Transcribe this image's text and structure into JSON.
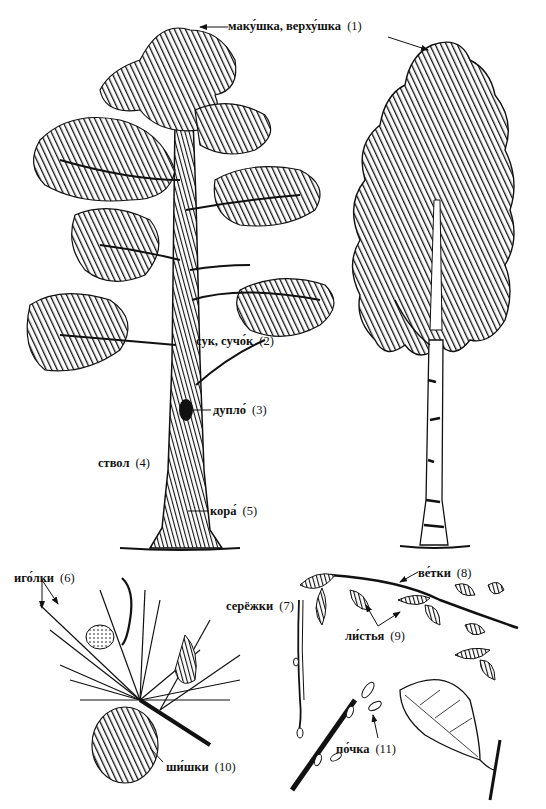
{
  "diagram": {
    "colors": {
      "ink": "#111111",
      "paper": "#ffffff"
    },
    "labels": [
      {
        "id": "1",
        "term": "маку́шка, верху́шка",
        "number": "(1)",
        "x": 228,
        "y": 22
      },
      {
        "id": "2",
        "term": "сук, сучо́к",
        "number": "(2)",
        "x": 196,
        "y": 335
      },
      {
        "id": "3",
        "term": "дупло́",
        "number": "(3)",
        "x": 213,
        "y": 404
      },
      {
        "id": "4",
        "term": "ствол",
        "number": "(4)",
        "x": 98,
        "y": 457
      },
      {
        "id": "5",
        "term": "кора́",
        "number": "(5)",
        "x": 210,
        "y": 505
      },
      {
        "id": "6",
        "term": "иго́лки",
        "number": "(6)",
        "x": 14,
        "y": 572
      },
      {
        "id": "7",
        "term": "серёжки",
        "number": "(7)",
        "x": 226,
        "y": 600
      },
      {
        "id": "8",
        "term": "ве́тки",
        "number": "(8)",
        "x": 418,
        "y": 567
      },
      {
        "id": "9",
        "term": "ли́стья",
        "number": "(9)",
        "x": 345,
        "y": 630
      },
      {
        "id": "10",
        "term": "ши́шки",
        "number": "(10)",
        "x": 166,
        "y": 761
      },
      {
        "id": "11",
        "term": "по́чка",
        "number": "(11)",
        "x": 336,
        "y": 743
      }
    ],
    "drawings": [
      {
        "id": "pine-tree",
        "name": "pine tree"
      },
      {
        "id": "birch-tree",
        "name": "birch tree"
      },
      {
        "id": "pine-branch",
        "name": "pine branch with needles and cones"
      },
      {
        "id": "birch-branch",
        "name": "birch branch with leaves"
      },
      {
        "id": "catkin",
        "name": "catkin"
      },
      {
        "id": "bud-twig",
        "name": "twig with buds"
      },
      {
        "id": "birch-leaf",
        "name": "single birch leaf"
      }
    ]
  }
}
